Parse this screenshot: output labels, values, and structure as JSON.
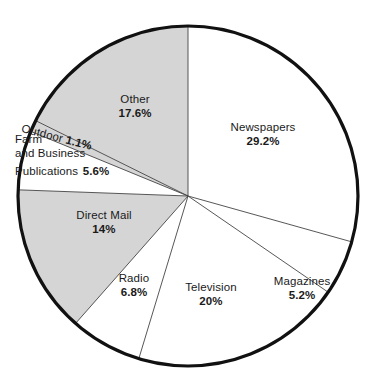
{
  "chart_data": {
    "type": "pie",
    "title": "",
    "subtitle": "",
    "xlabel": "",
    "ylabel": "",
    "legend_position": "none",
    "grid": false,
    "start_angle_deg": 0,
    "direction": "clockwise",
    "categories": [
      "Newspapers",
      "Magazines",
      "Television",
      "Radio",
      "Direct Mail",
      "Farm and Business Publications",
      "Outdoor",
      "Other"
    ],
    "values": [
      29.2,
      5.2,
      20.0,
      6.8,
      14.0,
      5.6,
      1.1,
      17.6
    ],
    "value_labels": [
      "29.2%",
      "5.2%",
      "20%",
      "6.8%",
      "14%",
      "5.6%",
      "1.1%",
      "17.6%"
    ],
    "slice_fills": [
      "#ffffff",
      "#ffffff",
      "#ffffff",
      "#ffffff",
      "#d5d5d5",
      "#ffffff",
      "#d5d5d5",
      "#d5d5d5"
    ],
    "slices": [
      {
        "name": "Newspapers",
        "value": 29.2,
        "label": "Newspapers",
        "value_label": "29.2%",
        "fill": "#ffffff",
        "start_deg": 0.0,
        "end_deg": 105.12
      },
      {
        "name": "Magazines",
        "value": 5.2,
        "label": "Magazines",
        "value_label": "5.2%",
        "fill": "#ffffff",
        "start_deg": 105.12,
        "end_deg": 123.84
      },
      {
        "name": "Television",
        "value": 20.0,
        "label": "Television",
        "value_label": "20%",
        "fill": "#ffffff",
        "start_deg": 123.84,
        "end_deg": 195.84
      },
      {
        "name": "Radio",
        "value": 6.8,
        "label": "Radio",
        "value_label": "6.8%",
        "fill": "#ffffff",
        "start_deg": 195.84,
        "end_deg": 220.32
      },
      {
        "name": "Direct Mail",
        "value": 14.0,
        "label": "Direct Mail",
        "value_label": "14%",
        "fill": "#d5d5d5",
        "start_deg": 220.32,
        "end_deg": 270.72
      },
      {
        "name": "Farm and Business Publications",
        "value": 5.6,
        "label": "Farm and Business Publications",
        "value_label": "5.6%",
        "fill": "#ffffff",
        "start_deg": 270.72,
        "end_deg": 290.88
      },
      {
        "name": "Outdoor",
        "value": 1.1,
        "label": "Outdoor",
        "value_label": "1.1%",
        "fill": "#d5d5d5",
        "start_deg": 290.88,
        "end_deg": 294.84
      },
      {
        "name": "Other",
        "value": 17.6,
        "label": "Other",
        "value_label": "17.6%",
        "fill": "#d5d5d5",
        "start_deg": 294.84,
        "end_deg": 358.2
      }
    ],
    "geometry": {
      "center_x": 188,
      "center_y": 196,
      "radius": 170,
      "outline_color": "#111111",
      "outline_width": 3.2,
      "divider_color": "#444444",
      "divider_width": 0.9
    }
  },
  "labels": {
    "newspapers": {
      "name": "Newspapers",
      "value": "29.2%"
    },
    "magazines": {
      "name": "Magazines",
      "value": "5.2%"
    },
    "television": {
      "name": "Television",
      "value": "20%"
    },
    "radio": {
      "name": "Radio",
      "value": "6.8%"
    },
    "direct_mail": {
      "name": "Direct Mail",
      "value": "14%"
    },
    "farm": {
      "line1": "Farm",
      "line2": "and Business",
      "line3": "Publications",
      "value": "5.6%"
    },
    "outdoor": {
      "name": "Outdoor ",
      "value": "1.1%"
    },
    "other": {
      "name": "Other",
      "value": "17.6%"
    }
  }
}
